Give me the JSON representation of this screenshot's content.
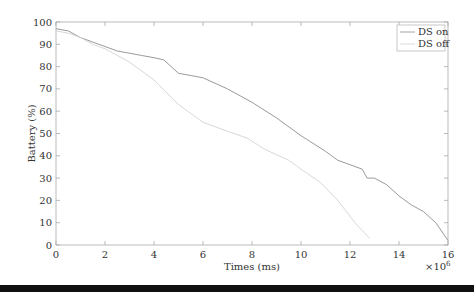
{
  "chart_data": {
    "type": "line",
    "title": "",
    "xlabel": "Times (ms)",
    "ylabel": "Battery (%)",
    "x_multiplier": "×10^6",
    "x_multiplier_base": "×10",
    "x_multiplier_exp": "6",
    "xlim": [
      0,
      16
    ],
    "ylim": [
      0,
      100
    ],
    "xticks": [
      0,
      2,
      4,
      6,
      8,
      10,
      12,
      14,
      16
    ],
    "yticks": [
      0,
      10,
      20,
      30,
      40,
      50,
      60,
      70,
      80,
      90,
      100
    ],
    "grid": false,
    "legend_position": "upper right",
    "series": [
      {
        "name": "DS on",
        "color": "#9a9a9a",
        "x": [
          0,
          0.5,
          1,
          1.5,
          2,
          2.5,
          3,
          3.5,
          4,
          4.4,
          4.7,
          5,
          5.5,
          6,
          7,
          8,
          9,
          10,
          11,
          11.5,
          12,
          12.5,
          12.7,
          13,
          13.5,
          14,
          14.5,
          15,
          15.5,
          16
        ],
        "y": [
          97,
          96,
          93,
          91,
          89,
          87,
          86,
          85,
          84,
          83,
          80,
          77,
          76,
          75,
          70,
          64,
          57,
          49,
          42,
          38,
          36,
          34,
          30,
          30,
          27,
          22,
          18,
          15,
          10,
          2
        ]
      },
      {
        "name": "DS off",
        "color": "#d8d8d8",
        "x": [
          0,
          0.5,
          1,
          1.5,
          2,
          3,
          4,
          5,
          6,
          7,
          7.8,
          8.5,
          9.5,
          10,
          10.8,
          11.5,
          12.2,
          12.8
        ],
        "y": [
          96,
          95,
          93,
          90,
          88,
          82,
          74,
          63,
          55,
          51,
          48,
          43,
          38,
          34,
          28,
          20,
          10,
          3
        ]
      }
    ]
  },
  "legend": {
    "items": [
      {
        "label": "DS on",
        "color": "#9a9a9a"
      },
      {
        "label": "DS off",
        "color": "#d8d8d8"
      }
    ]
  }
}
